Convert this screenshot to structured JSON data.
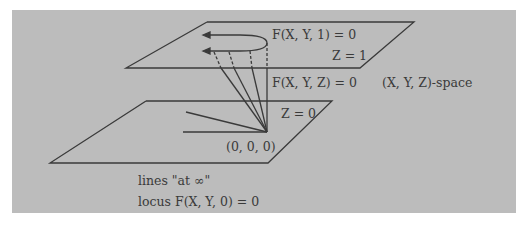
{
  "figure": {
    "colors": {
      "background": "#bcbcbc",
      "ink": "#3a3a3a"
    },
    "labels": {
      "upper_curve": "F(X, Y, 1) = 0",
      "upper_plane": "Z = 1",
      "cone_surface": "F(X, Y, Z) = 0",
      "space": "(X, Y, Z)-space",
      "lower_plane": "Z = 0",
      "origin": "(0, 0, 0)",
      "lines_at_infinity": "lines \"at ∞\"",
      "locus": "locus F(X, Y, 0) = 0"
    }
  }
}
